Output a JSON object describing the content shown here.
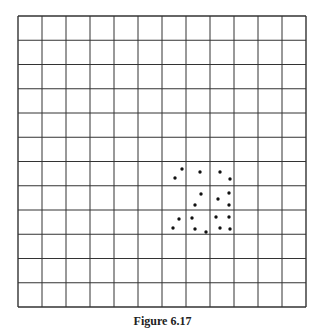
{
  "figure": {
    "caption": "Figure 6.17",
    "grid": {
      "rows": 12,
      "cols": 12,
      "left": 18,
      "top": 16,
      "right": 306,
      "bottom": 307,
      "line_color": "#333333",
      "background": "#ffffff"
    },
    "dot_color": "#111111",
    "dots": [
      [
        182,
        169
      ],
      [
        175,
        178
      ],
      [
        200,
        172
      ],
      [
        220,
        172
      ],
      [
        230,
        179
      ],
      [
        201,
        194
      ],
      [
        218,
        199
      ],
      [
        229,
        193
      ],
      [
        195,
        205
      ],
      [
        229,
        205
      ],
      [
        179,
        219
      ],
      [
        173,
        228
      ],
      [
        192,
        218
      ],
      [
        216,
        217
      ],
      [
        229,
        217
      ],
      [
        195,
        229
      ],
      [
        206,
        232
      ],
      [
        220,
        228
      ],
      [
        230,
        229
      ]
    ]
  }
}
